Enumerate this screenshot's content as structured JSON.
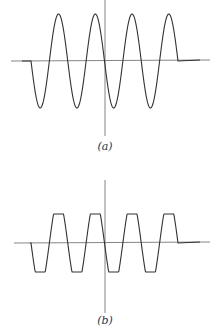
{
  "figure": {
    "panels": [
      {
        "id": "a",
        "label": "(a)",
        "waveform": "sine",
        "cycles": 4,
        "description": "Sinusoidal waveform, 4 full cycles, starting with negative half-cycle"
      },
      {
        "id": "b",
        "label": "(b)",
        "waveform": "clipped-sine (trapezoidal)",
        "cycles": 4,
        "description": "Same waveform with peaks clipped to flat plateaus"
      }
    ],
    "colors": {
      "line": "#444444",
      "axis": "#666666",
      "background": "#ffffff"
    }
  }
}
